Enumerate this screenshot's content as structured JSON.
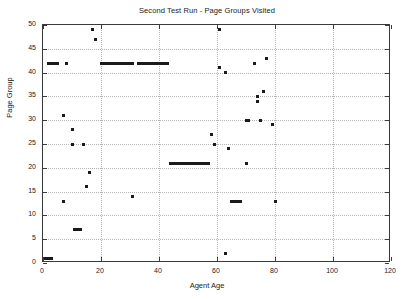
{
  "chart_data": {
    "type": "scatter",
    "title": "Second Test Run - Page Groups Visited",
    "xlabel": "Agent Age",
    "ylabel": "Page Group",
    "xlim": [
      0,
      120
    ],
    "ylim": [
      0,
      50
    ],
    "xticks": [
      0,
      20,
      40,
      60,
      80,
      100,
      120
    ],
    "yticks": [
      0,
      5,
      10,
      15,
      20,
      25,
      30,
      35,
      40,
      45,
      50
    ],
    "grid": true,
    "legend": null,
    "marker": "square",
    "marker_color": "#1a1a1a",
    "series": [
      {
        "name": "Page Groups Visited",
        "points": [
          [
            1,
            1
          ],
          [
            2,
            1
          ],
          [
            3,
            1
          ],
          [
            2,
            42
          ],
          [
            3,
            42
          ],
          [
            4,
            42
          ],
          [
            5,
            42
          ],
          [
            7,
            31
          ],
          [
            7,
            13
          ],
          [
            8,
            42
          ],
          [
            10,
            25
          ],
          [
            10,
            28
          ],
          [
            11,
            7
          ],
          [
            12,
            7
          ],
          [
            13,
            7
          ],
          [
            14,
            25
          ],
          [
            15,
            16
          ],
          [
            16,
            19
          ],
          [
            17,
            49
          ],
          [
            18,
            47
          ],
          [
            20,
            42
          ],
          [
            21,
            42
          ],
          [
            22,
            42
          ],
          [
            23,
            42
          ],
          [
            24,
            42
          ],
          [
            25,
            42
          ],
          [
            26,
            42
          ],
          [
            27,
            42
          ],
          [
            28,
            42
          ],
          [
            29,
            42
          ],
          [
            30,
            42
          ],
          [
            31,
            42
          ],
          [
            33,
            42
          ],
          [
            34,
            42
          ],
          [
            35,
            42
          ],
          [
            36,
            42
          ],
          [
            37,
            42
          ],
          [
            38,
            42
          ],
          [
            39,
            42
          ],
          [
            40,
            42
          ],
          [
            41,
            42
          ],
          [
            42,
            42
          ],
          [
            43,
            42
          ],
          [
            31,
            14
          ],
          [
            44,
            21
          ],
          [
            45,
            21
          ],
          [
            46,
            21
          ],
          [
            47,
            21
          ],
          [
            48,
            21
          ],
          [
            49,
            21
          ],
          [
            50,
            21
          ],
          [
            51,
            21
          ],
          [
            52,
            21
          ],
          [
            53,
            21
          ],
          [
            54,
            21
          ],
          [
            55,
            21
          ],
          [
            56,
            21
          ],
          [
            57,
            21
          ],
          [
            58,
            27
          ],
          [
            59,
            25
          ],
          [
            61,
            49
          ],
          [
            61,
            41
          ],
          [
            63,
            40
          ],
          [
            63,
            2
          ],
          [
            64,
            24
          ],
          [
            65,
            13
          ],
          [
            66,
            13
          ],
          [
            67,
            13
          ],
          [
            68,
            13
          ],
          [
            70,
            21
          ],
          [
            70,
            30
          ],
          [
            71,
            30
          ],
          [
            73,
            42
          ],
          [
            74,
            35
          ],
          [
            74,
            34
          ],
          [
            75,
            30
          ],
          [
            76,
            36
          ],
          [
            77,
            43
          ],
          [
            79,
            29
          ],
          [
            80,
            13
          ]
        ]
      }
    ]
  }
}
